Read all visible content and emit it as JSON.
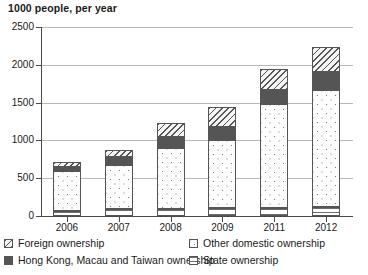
{
  "chart_data": {
    "type": "bar",
    "subtype": "stacked-bar",
    "title": "1000 people, per year",
    "xlabel": "",
    "ylabel": "",
    "categories": [
      "2006",
      "2007",
      "2008",
      "2009",
      "2011",
      "2012"
    ],
    "ylim": [
      0,
      2500
    ],
    "yticks": [
      0,
      500,
      1000,
      1500,
      2000,
      2500
    ],
    "ytick_labels": [
      "0",
      "500",
      "1000",
      "1500",
      "2000",
      "2500"
    ],
    "grid": true,
    "legend_position": "bottom",
    "series": [
      {
        "name": "State ownership",
        "pattern": "horizontal-lines",
        "values": [
          60,
          90,
          95,
          100,
          110,
          115
        ]
      },
      {
        "name": "Other domestic ownership",
        "pattern": "dotted",
        "values": [
          540,
          590,
          800,
          900,
          1370,
          1555
        ]
      },
      {
        "name": "Hong Kong, Macau and Taiwan ownership",
        "pattern": "solid-dark",
        "values": [
          50,
          105,
          145,
          175,
          185,
          235
        ]
      },
      {
        "name": "Foreign ownership",
        "pattern": "diagonal-hatch",
        "values": [
          70,
          90,
          195,
          270,
          275,
          335
        ]
      }
    ],
    "totals": [
      720,
      875,
      1235,
      1445,
      1940,
      2240
    ],
    "colors": {
      "axis": "#4a4a4a",
      "gridline": "#b9b9b9",
      "outline": "#555555",
      "state_ownership": "#ffffff",
      "other_domestic_ownership": "#fdfdfd",
      "hk_macau_taiwan_ownership": "#555555",
      "foreign_ownership": "#f2f2f2",
      "text": "#1a1a1a",
      "background": "#ffffff"
    }
  },
  "legend": {
    "items": [
      {
        "label": "Foreign ownership",
        "pattern": "diagonal-hatch"
      },
      {
        "label": "Other domestic ownership",
        "pattern": "dotted"
      },
      {
        "label": "Hong Kong, Macau and Taiwan ownership",
        "pattern": "solid-dark"
      },
      {
        "label": "State ownership",
        "pattern": "horizontal-lines"
      }
    ]
  }
}
